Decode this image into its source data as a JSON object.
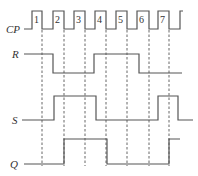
{
  "diagram": {
    "type": "timing-diagram",
    "signals": [
      {
        "name": "CP",
        "label": "CP"
      },
      {
        "name": "R",
        "label": "R"
      },
      {
        "name": "S",
        "label": "S"
      },
      {
        "name": "Q",
        "label": "Q"
      }
    ],
    "clock_pulse_numbers": [
      "1",
      "2",
      "3",
      "4",
      "5",
      "6",
      "7"
    ],
    "waveforms": {
      "CP": "0 1 0 1 0 1 0 1 0 1 0 1 0 1 0 1",
      "R": "high until pulse 2 rise, low until pulse 4 rise, high until pulse 6 rise, then low",
      "S": "low until pulse 2 rise, high until pulse 4 rise, low until pulse 7 rise, high, then low",
      "Q": "low until falling edge of pulse 2, high until falling edge of pulse 4, low until falling edge of pulse 7, then high"
    },
    "colors": {
      "line": "#555555",
      "text": "#333333",
      "background": "#ffffff"
    }
  }
}
